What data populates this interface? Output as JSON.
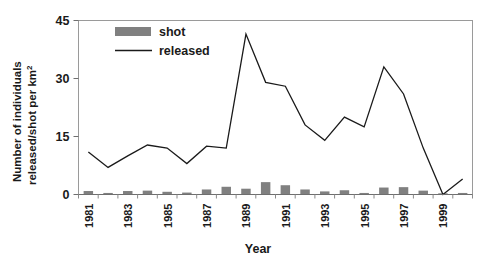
{
  "chart_data": {
    "type": "bar",
    "title": "",
    "xlabel": "Year",
    "ylabel_line1": "Number of individuals",
    "ylabel_line2": "released/shot per km",
    "ylabel_superscript": "2",
    "ylim": [
      0,
      45
    ],
    "yticks": [
      0,
      15,
      30,
      45
    ],
    "ytick_labels": [
      "0",
      "15",
      "30",
      "45"
    ],
    "grid": false,
    "legend_position": "top-left-inside",
    "x": [
      1981,
      1982,
      1983,
      1984,
      1985,
      1986,
      1987,
      1988,
      1989,
      1990,
      1991,
      1992,
      1993,
      1994,
      1995,
      1996,
      1997,
      1998,
      1999,
      2000
    ],
    "categories": [
      "1981",
      "1982",
      "1983",
      "1984",
      "1985",
      "1986",
      "1987",
      "1988",
      "1989",
      "1990",
      "1991",
      "1992",
      "1993",
      "1994",
      "1995",
      "1996",
      "1997",
      "1998",
      "1999",
      "2000"
    ],
    "xtick_labels_shown": [
      "1981",
      "1983",
      "1985",
      "1987",
      "1989",
      "1991",
      "1993",
      "1995",
      "1997",
      "1999"
    ],
    "xlim": [
      1980.5,
      2000.5
    ],
    "series": [
      {
        "name": "shot",
        "type": "bar",
        "color": "#808080",
        "values": [
          0.9,
          0.4,
          0.9,
          1.0,
          0.7,
          0.5,
          1.3,
          2.0,
          1.5,
          3.2,
          2.4,
          1.3,
          0.8,
          1.1,
          0.4,
          1.8,
          1.9,
          1.0,
          0.2,
          0.4
        ]
      },
      {
        "name": "released",
        "type": "line",
        "color": "#1a1a1a",
        "values": [
          11.0,
          7.0,
          10.0,
          12.8,
          12.0,
          8.0,
          12.5,
          12.0,
          41.5,
          29.0,
          28.0,
          18.0,
          14.0,
          20.0,
          17.5,
          33.0,
          26.0,
          12.0,
          0.0,
          4.0
        ]
      }
    ],
    "legend": [
      {
        "label": "shot",
        "marker": "bar-swatch",
        "color": "#808080"
      },
      {
        "label": "released",
        "marker": "line",
        "color": "#1a1a1a"
      }
    ]
  }
}
